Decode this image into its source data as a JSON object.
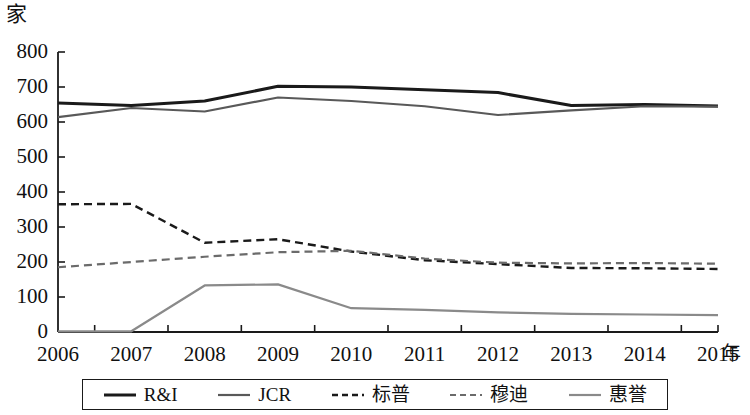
{
  "chart_data": {
    "type": "line",
    "title": "",
    "subtitle": "",
    "xlabel": "年",
    "ylabel": "家",
    "x": [
      2006,
      2007,
      2008,
      2009,
      2010,
      2011,
      2012,
      2013,
      2014,
      2015
    ],
    "categories": [
      "2006",
      "2007",
      "2008",
      "2009",
      "2010",
      "2011",
      "2012",
      "2013",
      "2014",
      "2015"
    ],
    "xlim": [
      2006,
      2015
    ],
    "ylim": [
      0,
      800
    ],
    "yticks": [
      0,
      100,
      200,
      300,
      400,
      500,
      600,
      700,
      800
    ],
    "ytick_labels": [
      "0",
      "100",
      "200",
      "300",
      "400",
      "500",
      "600",
      "700",
      "800"
    ],
    "grid": false,
    "legend_position": "bottom",
    "series": [
      {
        "name": "R&I",
        "style": "solid",
        "color": "#1a1a1a",
        "width": 3.0,
        "values": [
          654,
          647,
          660,
          702,
          700,
          692,
          684,
          647,
          650,
          646
        ]
      },
      {
        "name": "JCR",
        "style": "solid",
        "color": "#595959",
        "width": 2.2,
        "values": [
          614,
          640,
          630,
          670,
          660,
          645,
          620,
          633,
          645,
          644
        ]
      },
      {
        "name": "标普",
        "style": "dashed",
        "color": "#1a1a1a",
        "width": 2.4,
        "values": [
          365,
          366,
          255,
          265,
          230,
          205,
          194,
          183,
          182,
          180
        ]
      },
      {
        "name": "穆迪",
        "style": "dashed",
        "color": "#6b6b6b",
        "width": 2.2,
        "values": [
          185,
          200,
          215,
          228,
          232,
          210,
          198,
          196,
          197,
          195
        ]
      },
      {
        "name": "惠誉",
        "style": "solid",
        "color": "#8a8a8a",
        "width": 2.2,
        "values": [
          2,
          2,
          133,
          136,
          68,
          63,
          56,
          52,
          50,
          48
        ]
      }
    ]
  },
  "legend": {
    "items": [
      {
        "label": "R&I"
      },
      {
        "label": "JCR"
      },
      {
        "label": "标普"
      },
      {
        "label": "穆迪"
      },
      {
        "label": "惠誉"
      }
    ]
  },
  "axes": {
    "y_unit": "家",
    "x_unit": "年"
  }
}
